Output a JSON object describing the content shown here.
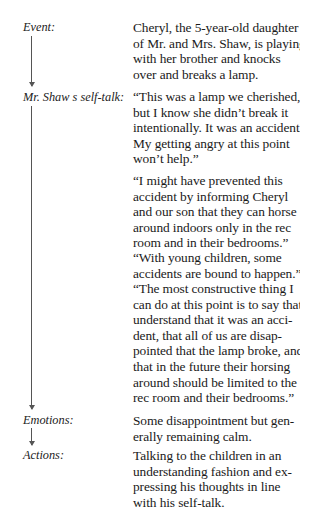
{
  "rows": [
    {
      "label": "Event:",
      "paragraphs": [
        [
          "Cheryl, the 5-year-old daughter",
          "of Mr. and Mrs. Shaw, is playing",
          "with her brother and knocks",
          "over and breaks a lamp."
        ]
      ]
    },
    {
      "label": "Mr. Shaw s self-talk:",
      "paragraphs": [
        [
          "“This was a lamp we cherished,",
          "but I know she didn’t break it",
          "intentionally. It was an accident.",
          "My getting angry at this point",
          "won’t help.”"
        ],
        [
          "“I might have prevented this",
          "accident by informing Cheryl",
          "and our son that they can horse",
          "around indoors only in the rec",
          "room and in their bedrooms.”"
        ],
        [
          "“With young children, some",
          "accidents are bound to happen.”"
        ],
        [
          "“The most constructive thing I",
          "can do at this point is to say that I",
          "understand that it was an acci-",
          "dent, that all of us are disap-",
          "pointed that the lamp broke, and",
          "that in the future their horsing",
          "around should be limited to the",
          "rec room and their bedrooms.”"
        ]
      ]
    },
    {
      "label": "Emotions:",
      "paragraphs": [
        [
          "Some disappointment but gen-",
          "erally remaining calm."
        ]
      ]
    },
    {
      "label": "Actions:",
      "paragraphs": [
        [
          "Talking to the children in an",
          "understanding fashion and ex-",
          "pressing his thoughts in line",
          "with his self-talk."
        ]
      ]
    }
  ]
}
